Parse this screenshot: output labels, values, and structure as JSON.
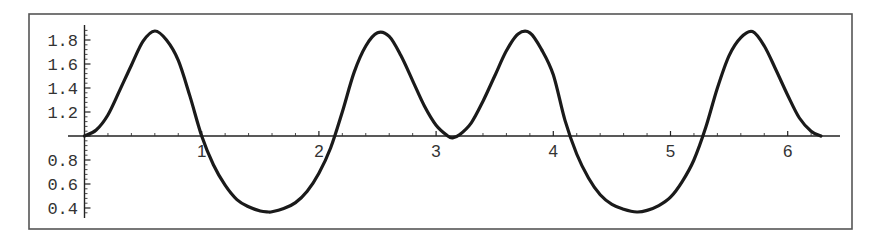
{
  "chart_data": {
    "type": "line",
    "title": "",
    "xlabel": "",
    "ylabel": "",
    "xlim": [
      0,
      6.2832
    ],
    "ylim": [
      0.35,
      1.9
    ],
    "axes_origin": {
      "x": 0,
      "y": 1.0
    },
    "grid": false,
    "legend": null,
    "x_ticks": [
      1,
      2,
      3,
      4,
      5,
      6
    ],
    "x_tick_labels": [
      "1",
      "2",
      "3",
      "4",
      "5",
      "6"
    ],
    "y_ticks": [
      1.8,
      1.6,
      1.4,
      1.2,
      0.8,
      0.6,
      0.4
    ],
    "y_tick_labels": [
      "1.8",
      "1.6",
      "1.4",
      "1.2",
      "0.8",
      "0.6",
      "0.4"
    ],
    "series": [
      {
        "name": "f(x)",
        "x": [
          0,
          0.1,
          0.2,
          0.3,
          0.4,
          0.5,
          0.6,
          0.7,
          0.8,
          0.9,
          1.0,
          1.1,
          1.2,
          1.3,
          1.4,
          1.5,
          1.5708,
          1.6,
          1.7,
          1.8,
          1.9,
          2.0,
          2.1,
          2.2,
          2.3,
          2.4,
          2.5,
          2.6,
          2.7,
          2.8,
          2.9,
          3.0,
          3.1,
          3.1416,
          3.2,
          3.3,
          3.4,
          3.5,
          3.6,
          3.7,
          3.8,
          3.9,
          4.0,
          4.1,
          4.2,
          4.3,
          4.4,
          4.5,
          4.6,
          4.7124,
          4.8,
          4.9,
          5.0,
          5.1,
          5.2,
          5.3,
          5.4,
          5.5,
          5.6,
          5.7,
          5.8,
          5.9,
          6.0,
          6.1,
          6.2,
          6.2832
        ],
        "y": [
          1.0,
          1.05,
          1.175,
          1.38,
          1.59,
          1.79,
          1.875,
          1.8,
          1.63,
          1.33,
          1.0,
          0.76,
          0.59,
          0.47,
          0.41,
          0.375,
          0.367,
          0.368,
          0.395,
          0.445,
          0.54,
          0.69,
          0.9,
          1.2,
          1.53,
          1.75,
          1.86,
          1.83,
          1.67,
          1.46,
          1.25,
          1.09,
          1.0,
          0.985,
          1.01,
          1.11,
          1.29,
          1.5,
          1.71,
          1.85,
          1.86,
          1.72,
          1.51,
          1.13,
          0.85,
          0.65,
          0.51,
          0.43,
          0.39,
          0.367,
          0.38,
          0.42,
          0.49,
          0.62,
          0.8,
          1.07,
          1.4,
          1.67,
          1.82,
          1.87,
          1.75,
          1.55,
          1.34,
          1.15,
          1.04,
          1.0
        ]
      }
    ],
    "colors": {
      "curve": "#1a1a1a",
      "axes": "#222222",
      "frame": "#555555",
      "background": "#ffffff"
    }
  }
}
